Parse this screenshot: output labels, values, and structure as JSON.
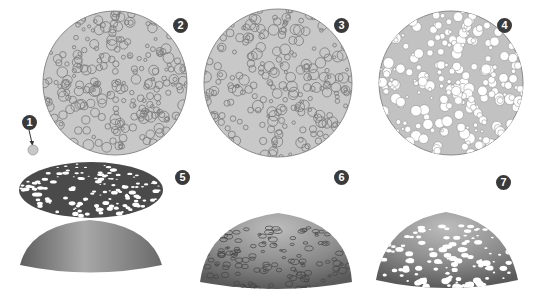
{
  "diagram": {
    "steps": [
      {
        "id": 1,
        "label": "1",
        "caption": "single circle"
      },
      {
        "id": 2,
        "label": "2",
        "caption": "disk with packed circle outlines"
      },
      {
        "id": 3,
        "label": "3",
        "caption": "disk with refined circle outlines"
      },
      {
        "id": 4,
        "label": "4",
        "caption": "disk with holes cut"
      },
      {
        "id": 5,
        "label": "5",
        "caption": "perforated disk above dome"
      },
      {
        "id": 6,
        "label": "6",
        "caption": "dome with projected circle outlines"
      },
      {
        "id": 7,
        "label": "7",
        "caption": "perforated dome"
      }
    ],
    "colors": {
      "disk_fill": "#c8c8c8",
      "disk_stroke": "#8a8a8a",
      "circle_stroke": "#7a7a7a",
      "badge": "#3a3a3a",
      "dark_disk": "#4a4a4a",
      "dome_dark": "#555555",
      "dome_light": "#c0c0c0"
    }
  }
}
